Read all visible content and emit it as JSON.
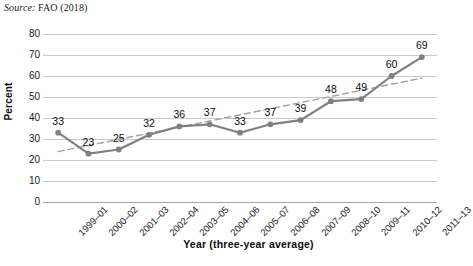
{
  "source_note": {
    "label": "Source:",
    "text": "FAO (2018)"
  },
  "chart_data": {
    "type": "line",
    "title": "",
    "subtitle": "",
    "xlabel": "Year (three-year average)",
    "ylabel": "Percent",
    "categories": [
      "1999–01",
      "2000–02",
      "2001–03",
      "2002–04",
      "2003–05",
      "2004–06",
      "2005–07",
      "2006–08",
      "2007–09",
      "2008–10",
      "2009–11",
      "2010–12",
      "2011–13"
    ],
    "values": [
      33,
      23,
      25,
      32,
      36,
      37,
      33,
      37,
      39,
      48,
      49,
      60,
      69
    ],
    "data_labels": [
      "33",
      "23",
      "25",
      "32",
      "36",
      "37",
      "33",
      "37",
      "39",
      "48",
      "49",
      "60",
      "69"
    ],
    "ylim": [
      0,
      80
    ],
    "yticks": [
      80,
      70,
      60,
      50,
      40,
      30,
      20,
      10,
      0
    ],
    "ytick_labels": [
      "80",
      "70",
      "60",
      "50",
      "40",
      "30",
      "20",
      "10",
      "0"
    ],
    "grid": true,
    "legend": "none",
    "series_color": "#808080",
    "marker": "circle",
    "marker_color": "#808080",
    "trendline": {
      "style": "dashed",
      "color": "#a0a0a0",
      "start_value": 24,
      "end_value": 59
    }
  }
}
